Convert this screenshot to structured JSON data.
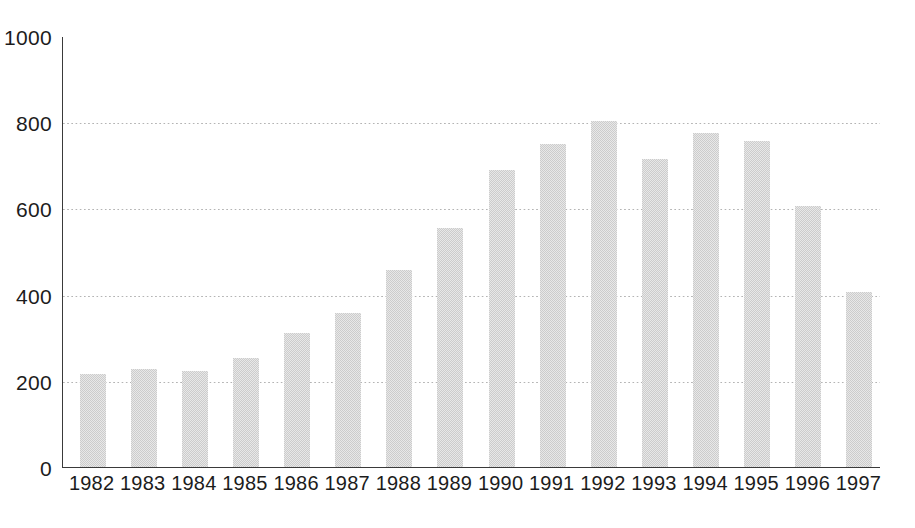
{
  "chart_data": {
    "type": "bar",
    "title": "",
    "subtitle": "",
    "xlabel": "",
    "ylabel": "",
    "categories": [
      "1982",
      "1983",
      "1984",
      "1985",
      "1986",
      "1987",
      "1988",
      "1989",
      "1990",
      "1991",
      "1992",
      "1993",
      "1994",
      "1995",
      "1996",
      "1997"
    ],
    "values": [
      215,
      228,
      222,
      254,
      310,
      358,
      458,
      555,
      690,
      750,
      803,
      715,
      775,
      757,
      605,
      405
    ],
    "series": [
      {
        "name": "",
        "values": [
          215,
          228,
          222,
          254,
          310,
          358,
          458,
          555,
          690,
          750,
          803,
          715,
          775,
          757,
          605,
          405
        ]
      }
    ],
    "ylim": [
      0,
      1000
    ],
    "yticks": [
      0,
      200,
      400,
      600,
      800,
      1000
    ],
    "ytick_labels": [
      "0",
      "200",
      "400",
      "600",
      "800",
      "1000"
    ],
    "xlim_categories": 16,
    "grid": {
      "horizontal": true,
      "vertical": false,
      "style": "dotted",
      "color": "#b4b4b4"
    },
    "legend": {
      "visible": false,
      "position": "none",
      "entries": []
    },
    "annotations": [],
    "colors": {
      "bar_fill": "#cccccc",
      "bar_edge": "#cccccc",
      "axis": "#3a3a3a",
      "grid": "#b4b4b4",
      "text": "#1c1c1c",
      "background": "#ffffff"
    },
    "axis": {
      "left_spine": true,
      "bottom_spine": true,
      "top_spine": false,
      "right_spine": false
    }
  }
}
